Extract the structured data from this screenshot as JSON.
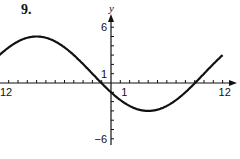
{
  "problem_number": "9.",
  "chart_data": {
    "type": "line",
    "title": "",
    "xlabel": "",
    "ylabel": "y",
    "xlim": [
      -12,
      12
    ],
    "ylim": [
      -6,
      6
    ],
    "x_tick_step": 1,
    "y_tick_step": 1,
    "x_tick_labels": [
      {
        "value": -12,
        "text": "12"
      },
      {
        "value": 1,
        "text": "1"
      },
      {
        "value": 12,
        "text": "12"
      }
    ],
    "y_tick_labels": [
      {
        "value": 6,
        "text": "6"
      },
      {
        "value": 1,
        "text": "1"
      },
      {
        "value": -6,
        "text": "−6"
      }
    ],
    "grid": false,
    "series": [
      {
        "name": "y = 1 + 4cos(π(x+8)/12)",
        "x": [
          -12,
          -10,
          -8,
          -6,
          -4,
          -2,
          0,
          2,
          4,
          6,
          8,
          10,
          12
        ],
        "values": [
          4.46,
          4.86,
          5,
          4.86,
          4.46,
          3,
          -1,
          -2.46,
          -3,
          -2.46,
          -1,
          1,
          3
        ]
      }
    ]
  }
}
